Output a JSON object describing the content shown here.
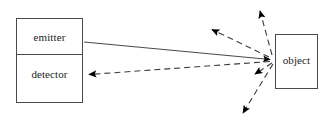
{
  "diagram": {
    "colors": {
      "stroke": "#4a4a4a",
      "arrow_fill": "#000000",
      "text": "#1b1b1b",
      "background": "#ffffff"
    },
    "boxes": [
      {
        "id": "emitter",
        "label": "emitter",
        "x": 16,
        "y": 18,
        "width": 67,
        "height": 37
      },
      {
        "id": "detector",
        "label": "detector",
        "x": 16,
        "y": 55,
        "width": 67,
        "height": 48
      },
      {
        "id": "object",
        "label": "object",
        "x": 275,
        "y": 34,
        "width": 43,
        "height": 55
      }
    ],
    "rays": [
      {
        "id": "emitted-beam",
        "style": "solid",
        "from": "emitter",
        "to": "object",
        "arrowhead": "end",
        "x1": 84,
        "y1": 42,
        "x2": 272,
        "y2": 60
      },
      {
        "id": "reflected-to-detector",
        "style": "dashed",
        "from": "object",
        "to": "detector",
        "arrowhead": "end",
        "x1": 271,
        "y1": 61,
        "x2": 86,
        "y2": 75
      },
      {
        "id": "scatter-upper-left",
        "style": "dashed",
        "from": "object",
        "to": "",
        "arrowhead": "end",
        "x1": 270,
        "y1": 57,
        "x2": 208,
        "y2": 27
      },
      {
        "id": "scatter-up",
        "style": "dashed",
        "from": "object",
        "to": "",
        "arrowhead": "end",
        "x1": 272,
        "y1": 55,
        "x2": 258,
        "y2": 7
      },
      {
        "id": "scatter-lower-left",
        "style": "dashed",
        "from": "object",
        "to": "",
        "arrowhead": "end",
        "x1": 272,
        "y1": 63,
        "x2": 252,
        "y2": 76
      },
      {
        "id": "scatter-down",
        "style": "dashed",
        "from": "object",
        "to": "",
        "arrowhead": "end",
        "x1": 273,
        "y1": 64,
        "x2": 240,
        "y2": 117
      }
    ]
  }
}
